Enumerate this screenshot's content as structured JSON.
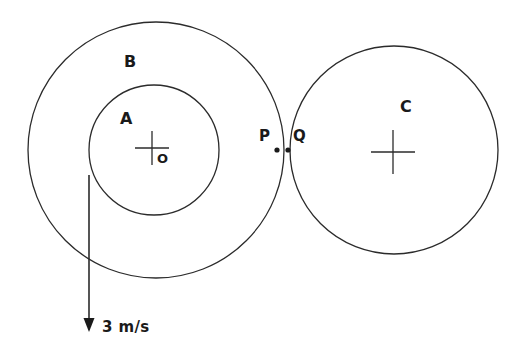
{
  "figure": {
    "background_color": "#ffffff",
    "stroke_color": "#2b2b2b",
    "text_color": "#1a1a1a",
    "width": 512,
    "height": 352
  },
  "labels": {
    "outer_circle": "B",
    "inner_circle": "A",
    "center_point": "O",
    "contact_left": "P",
    "contact_right": "Q",
    "right_circle": "C",
    "velocity": "3 m/s"
  },
  "chart_data": {
    "type": "diagram",
    "units": "px",
    "shapes": [
      {
        "name": "circle-B",
        "kind": "circle",
        "label": "B",
        "cx": 156,
        "cy": 150,
        "r": 128,
        "fill": "none",
        "stroke": "#2b2b2b",
        "stroke_width": 1.3
      },
      {
        "name": "circle-A",
        "kind": "circle",
        "label": "A",
        "cx": 154,
        "cy": 150,
        "r": 65,
        "fill": "none",
        "stroke": "#2b2b2b",
        "stroke_width": 1.3
      },
      {
        "name": "circle-C",
        "kind": "circle",
        "label": "C",
        "cx": 394,
        "cy": 150,
        "r": 104,
        "fill": "none",
        "stroke": "#2b2b2b",
        "stroke_width": 1.3
      },
      {
        "name": "cross-O",
        "kind": "cross",
        "label": "O",
        "cx": 152,
        "cy": 148,
        "half_width": 17,
        "half_height": 17
      },
      {
        "name": "cross-C-center",
        "kind": "cross",
        "label": "",
        "cx": 393,
        "cy": 152,
        "half_width": 22,
        "half_height": 22
      },
      {
        "name": "point-P",
        "kind": "dot",
        "label": "P",
        "cx": 277,
        "cy": 150,
        "r": 2.6
      },
      {
        "name": "point-Q",
        "kind": "dot",
        "label": "Q",
        "cx": 288,
        "cy": 150,
        "r": 2.6
      },
      {
        "name": "velocity-arrow",
        "kind": "arrow",
        "label": "3 m/s",
        "x1": 89,
        "y1": 175,
        "x2": 89,
        "y2": 332,
        "direction": "down",
        "magnitude": 3,
        "unit": "m/s"
      }
    ],
    "annotations": [
      {
        "text": "B",
        "x": 130,
        "y": 62
      },
      {
        "text": "A",
        "x": 126,
        "y": 119
      },
      {
        "text": "O",
        "x": 162,
        "y": 159
      },
      {
        "text": "P",
        "x": 265,
        "y": 137
      },
      {
        "text": "Q",
        "x": 299,
        "y": 137
      },
      {
        "text": "C",
        "x": 406,
        "y": 107
      },
      {
        "text": "3 m/s",
        "x": 128,
        "y": 328
      }
    ]
  }
}
